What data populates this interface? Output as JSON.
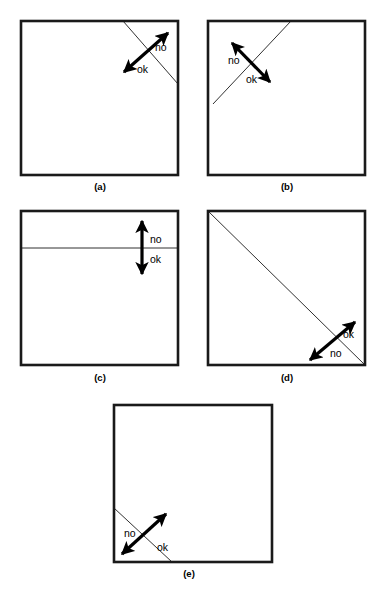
{
  "figure": {
    "style": {
      "background": "#ffffff",
      "box_stroke": "#1a1a1a",
      "crease_stroke": "#1a1a1a",
      "arrow_fill": "#000000",
      "label_color": "#000000"
    },
    "labels": {
      "no": "no",
      "ok": "ok"
    },
    "panels": [
      {
        "id": "a",
        "caption": "(a)",
        "caption_x": 100,
        "caption_y": 190,
        "box": {
          "x": 21,
          "y": 21,
          "w": 157,
          "h": 154
        },
        "crease": {
          "x1": 123,
          "y1": 21,
          "x2": 178,
          "y2": 84
        },
        "crease_description": "diagonal from top edge to right edge near top-right corner",
        "arrow": {
          "x1": 124,
          "y1": 72,
          "x2": 168,
          "y2": 33
        },
        "arrow_description": "double-headed arrow perpendicular to crease, pointing up-right and down-left",
        "label_no": {
          "text": "no",
          "x": 155,
          "y": 51
        },
        "label_ok": {
          "text": "ok",
          "x": 137,
          "y": 73
        }
      },
      {
        "id": "b",
        "caption": "(b)",
        "caption_x": 287,
        "caption_y": 190,
        "box": {
          "x": 208,
          "y": 21,
          "w": 157,
          "h": 154
        },
        "crease": {
          "x1": 213,
          "y1": 104,
          "x2": 291,
          "y2": 21
        },
        "crease_description": "diagonal from left portion of lower-left up to top edge",
        "arrow": {
          "x1": 270,
          "y1": 82,
          "x2": 232,
          "y2": 43
        },
        "arrow_description": "double-headed arrow perpendicular to crease, pointing up-left and down-right",
        "label_no": {
          "text": "no",
          "x": 228,
          "y": 64
        },
        "label_ok": {
          "text": "ok",
          "x": 246,
          "y": 83
        }
      },
      {
        "id": "c",
        "caption": "(c)",
        "caption_x": 100,
        "caption_y": 381,
        "box": {
          "x": 21,
          "y": 211,
          "w": 157,
          "h": 154
        },
        "crease": {
          "x1": 21,
          "y1": 248,
          "x2": 178,
          "y2": 248
        },
        "crease_description": "horizontal crease near the top of the square",
        "arrow": {
          "x1": 142,
          "y1": 274,
          "x2": 142,
          "y2": 221
        },
        "arrow_description": "vertical double-headed arrow crossing the horizontal crease",
        "label_no": {
          "text": "no",
          "x": 150,
          "y": 243
        },
        "label_ok": {
          "text": "ok",
          "x": 150,
          "y": 263
        }
      },
      {
        "id": "d",
        "caption": "(d)",
        "caption_x": 287,
        "caption_y": 381,
        "box": {
          "x": 208,
          "y": 211,
          "w": 157,
          "h": 154
        },
        "crease": {
          "x1": 208,
          "y1": 211,
          "x2": 365,
          "y2": 365
        },
        "crease_description": "full diagonal from top-left corner to bottom-right corner",
        "arrow": {
          "x1": 310,
          "y1": 360,
          "x2": 355,
          "y2": 322
        },
        "arrow_description": "double-headed arrow perpendicular to diagonal near the bottom-right corner",
        "label_no": {
          "text": "no",
          "x": 330,
          "y": 357
        },
        "label_ok": {
          "text": "ok",
          "x": 343,
          "y": 338
        }
      },
      {
        "id": "e",
        "caption": "(e)",
        "caption_x": 189,
        "caption_y": 577,
        "box": {
          "x": 114,
          "y": 405,
          "w": 158,
          "h": 157
        },
        "crease": {
          "x1": 114,
          "y1": 508,
          "x2": 172,
          "y2": 562
        },
        "crease_description": "short diagonal cutting the bottom-left corner",
        "arrow": {
          "x1": 122,
          "y1": 554,
          "x2": 166,
          "y2": 514
        },
        "arrow_description": "double-headed arrow perpendicular to the corner crease",
        "label_no": {
          "text": "no",
          "x": 124,
          "y": 537
        },
        "label_ok": {
          "text": "ok",
          "x": 157,
          "y": 551
        }
      }
    ]
  }
}
